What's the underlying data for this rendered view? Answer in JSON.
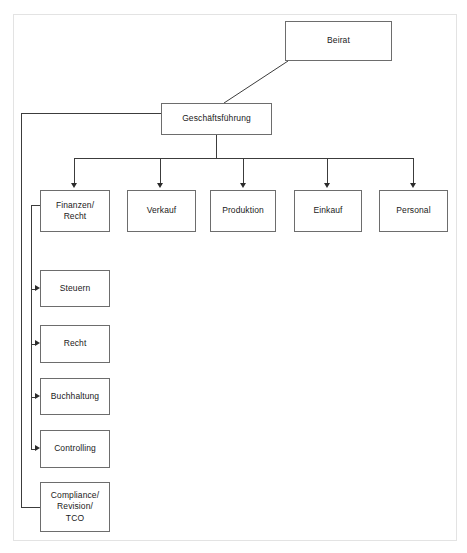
{
  "diagram": {
    "type": "organizational-chart",
    "background_color": "#ffffff",
    "frame_border_color": "#e3e3e3",
    "node_border_color": "#6d6d6d",
    "connector_color": "#3c3c3c",
    "text_color": "#1a1a1a"
  },
  "nodes": {
    "beirat": {
      "label": "Beirat",
      "x": 285,
      "y": 21,
      "w": 107,
      "h": 40
    },
    "geschaeftsfuehrung": {
      "label": "Geschäftsführung",
      "x": 161,
      "y": 103,
      "w": 111,
      "h": 32
    },
    "finanzen_recht": {
      "label": "Finanzen/\nRecht",
      "x": 40,
      "y": 190,
      "w": 70,
      "h": 42
    },
    "verkauf": {
      "label": "Verkauf",
      "x": 127,
      "y": 190,
      "w": 69,
      "h": 42
    },
    "produktion": {
      "label": "Produktion",
      "x": 210,
      "y": 190,
      "w": 66,
      "h": 42
    },
    "einkauf": {
      "label": "Einkauf",
      "x": 294,
      "y": 190,
      "w": 68,
      "h": 42
    },
    "personal": {
      "label": "Personal",
      "x": 379,
      "y": 190,
      "w": 69,
      "h": 42
    },
    "steuern": {
      "label": "Steuern",
      "x": 40,
      "y": 270,
      "w": 70,
      "h": 37
    },
    "recht": {
      "label": "Recht",
      "x": 40,
      "y": 325,
      "w": 70,
      "h": 38
    },
    "buchhaltung": {
      "label": "Buchhaltung",
      "x": 40,
      "y": 378,
      "w": 70,
      "h": 37
    },
    "controlling": {
      "label": "Controlling",
      "x": 40,
      "y": 430,
      "w": 70,
      "h": 38
    },
    "compliance": {
      "label": "Compliance/\nRevision/\nTCO",
      "x": 40,
      "y": 482,
      "w": 70,
      "h": 50
    }
  },
  "hierarchy": {
    "top": "beirat",
    "executive": "geschaeftsfuehrung",
    "divisions": [
      "finanzen_recht",
      "verkauf",
      "produktion",
      "einkauf",
      "personal"
    ],
    "finance_subunits": [
      "steuern",
      "recht",
      "buchhaltung",
      "controlling",
      "compliance"
    ]
  }
}
